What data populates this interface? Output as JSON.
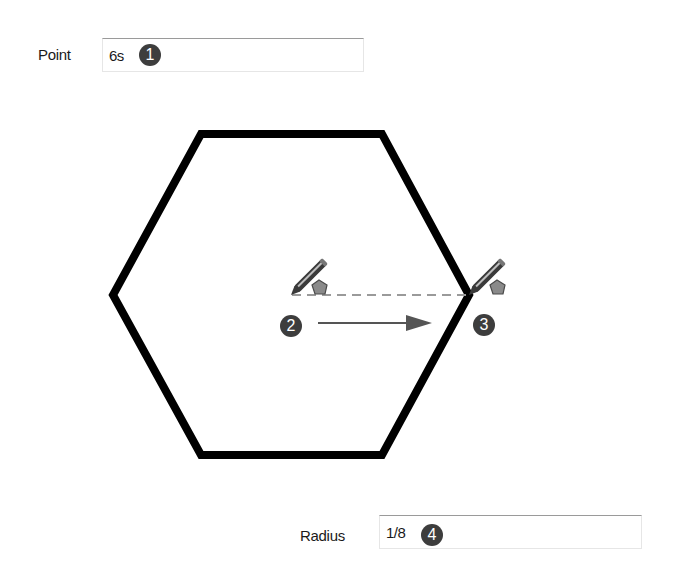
{
  "point_field": {
    "label": "Point",
    "value": "6s",
    "callout": "1"
  },
  "radius_field": {
    "label": "Radius",
    "value": "1/8",
    "callout": "4"
  },
  "diagram": {
    "shape": "hexagon",
    "start_callout": "2",
    "end_callout": "3",
    "cursor_icon": "pencil-polygon-icon",
    "colors": {
      "outline": "#000000",
      "dashed_line": "#9a9a9a",
      "arrow": "#555555",
      "badge": "#3d3d3d",
      "polygon_icon": "#8a8a8a"
    }
  }
}
